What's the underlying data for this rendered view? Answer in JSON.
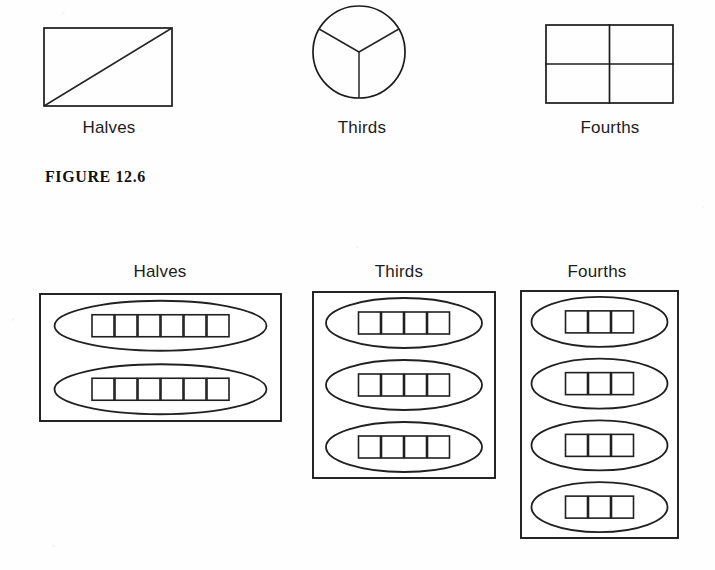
{
  "figure": {
    "caption": "FIGURE 12.6"
  },
  "area_models": {
    "items": [
      {
        "label": "Halves",
        "shape": "rectangle-with-diagonal",
        "parts": 2,
        "x": 44,
        "y": 28,
        "width": 128,
        "height": 78,
        "label_x": 109,
        "label_y": 118
      },
      {
        "label": "Thirds",
        "shape": "circle-divided-in-thirds",
        "parts": 3,
        "cx": 359,
        "cy": 52,
        "rx": 46,
        "ry": 46,
        "label_x": 362,
        "label_y": 118
      },
      {
        "label": "Fourths",
        "shape": "rectangle-quartered",
        "parts": 4,
        "x": 546,
        "y": 25,
        "width": 127,
        "height": 78,
        "label_x": 610,
        "label_y": 118
      }
    ]
  },
  "set_models": {
    "items": [
      {
        "label": "Halves",
        "groups": 2,
        "items_per_group": 3,
        "squares_per_oval": 6,
        "total_items": 12,
        "box_x": 40,
        "box_y": 294,
        "box_width": 241,
        "box_height": 127,
        "label_x": 160,
        "label_y": 262,
        "oval_rx": 106,
        "oval_ry": 25,
        "square_size": 22,
        "square_gap": 1
      },
      {
        "label": "Thirds",
        "groups": 3,
        "items_per_group": 4,
        "squares_per_oval": 4,
        "total_items": 12,
        "box_x": 313,
        "box_y": 292,
        "box_width": 182,
        "box_height": 186,
        "label_x": 399,
        "label_y": 262,
        "oval_rx": 78,
        "oval_ry": 25,
        "square_size": 22,
        "square_gap": 1
      },
      {
        "label": "Fourths",
        "groups": 4,
        "items_per_group": 3,
        "squares_per_oval": 3,
        "total_items": 12,
        "box_x": 521,
        "box_y": 291,
        "box_width": 157,
        "box_height": 247,
        "label_x": 597,
        "label_y": 262,
        "oval_rx": 68,
        "oval_ry": 25,
        "square_size": 22,
        "square_gap": 1
      }
    ]
  },
  "colors": {
    "ink": "#1b1b1b",
    "paper": "#fefefe",
    "text": "#1c1c1c"
  }
}
